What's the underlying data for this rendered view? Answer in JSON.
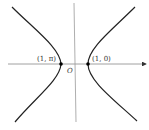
{
  "diagram": {
    "title": "",
    "labels": {
      "left_vertex": "(1, π)",
      "right_vertex": "(1, 0)",
      "origin": "O"
    },
    "colors": {
      "axis": "#888888",
      "curve": "#222222",
      "point": "#000000"
    }
  }
}
